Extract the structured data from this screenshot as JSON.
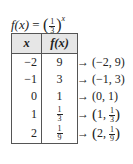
{
  "formula": {
    "lhs": "f(x)",
    "equals": "=",
    "base_numerator": "1",
    "base_denominator": "3",
    "exponent": "x",
    "text": "f(x) = (1/3)^x"
  },
  "table": {
    "headers": [
      "x",
      "f(x)"
    ],
    "rows": [
      {
        "x": "−2",
        "fx": "9",
        "fx_num": null,
        "fx_den": null,
        "point_x": "−2",
        "point_y": "9",
        "point_y_num": null,
        "point_y_den": null
      },
      {
        "x": "−1",
        "fx": "3",
        "fx_num": null,
        "fx_den": null,
        "point_x": "−1",
        "point_y": "3",
        "point_y_num": null,
        "point_y_den": null
      },
      {
        "x": "0",
        "fx": "1",
        "fx_num": null,
        "fx_den": null,
        "point_x": "0",
        "point_y": "1",
        "point_y_num": null,
        "point_y_den": null
      },
      {
        "x": "1",
        "fx": "1/3",
        "fx_num": "1",
        "fx_den": "3",
        "point_x": "1",
        "point_y": "1/3",
        "point_y_num": "1",
        "point_y_den": "3"
      },
      {
        "x": "2",
        "fx": "1/9",
        "fx_num": "1",
        "fx_den": "9",
        "point_x": "2",
        "point_y": "1/9",
        "point_y_num": "1",
        "point_y_den": "9"
      }
    ]
  },
  "arrow_symbol": "→",
  "points": [
    "(−2, 9)",
    "(−1, 3)",
    "(0, 1)",
    "(1, 1/3)",
    "(2, 1/9)"
  ],
  "chart_data": {
    "type": "table",
    "columns": [
      "x",
      "f(x)"
    ],
    "x": [
      -2,
      -1,
      0,
      1,
      2
    ],
    "values": [
      9,
      3,
      1,
      0.3333,
      0.1111
    ],
    "points": [
      [
        -2,
        9
      ],
      [
        -1,
        3
      ],
      [
        0,
        1
      ],
      [
        1,
        "1/3"
      ],
      [
        2,
        "1/9"
      ]
    ]
  }
}
